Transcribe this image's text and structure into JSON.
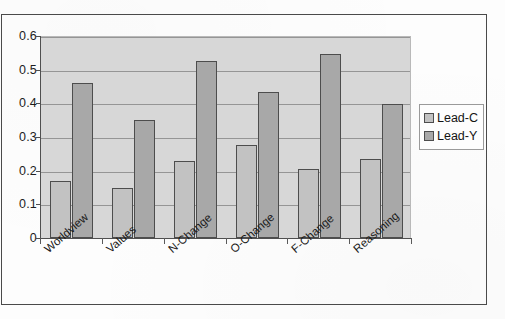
{
  "chart_data": {
    "type": "bar",
    "title": "",
    "subtitle": "",
    "xlabel": "",
    "ylabel": "",
    "categories": [
      "Worldview",
      "Values",
      "N-Change",
      "O-Change",
      "F-Change",
      "Reasoning"
    ],
    "series": [
      {
        "name": "Lead-C",
        "color": "#c2c2c2",
        "values": [
          0.17,
          0.15,
          0.23,
          0.275,
          0.205,
          0.235
        ]
      },
      {
        "name": "Lead-Y",
        "color": "#a8a8a8",
        "values": [
          0.46,
          0.35,
          0.525,
          0.435,
          0.547,
          0.398
        ]
      }
    ],
    "ylim": [
      0,
      0.6
    ],
    "ytick_values": [
      0,
      0.1,
      0.2,
      0.3,
      0.4,
      0.5,
      0.6
    ],
    "ytick_labels": [
      "0",
      "0.1",
      "0.2",
      "0.3",
      "0.4",
      "0.5",
      "0.6"
    ],
    "grid": true,
    "grid_axis": "y",
    "legend_position": "right",
    "plot_background": "#d7d7d7",
    "bar_border_color": "#4d4d4d",
    "x_tick_label_rotation": -41
  },
  "legend": {
    "entries": [
      {
        "label": "Lead-C"
      },
      {
        "label": "Lead-Y"
      }
    ]
  }
}
